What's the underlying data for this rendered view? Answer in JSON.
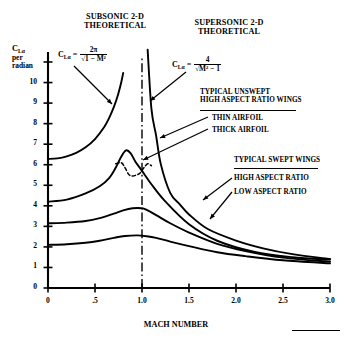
{
  "chart_data": {
    "type": "line",
    "xlabel": "MACH NUMBER",
    "ylabel": "C_Lα per radian",
    "xlim": [
      0,
      3.0
    ],
    "ylim": [
      0,
      11
    ],
    "grid": false,
    "legend_position": "right-annotations",
    "xticks": [
      "0",
      ".5",
      "1.0",
      "1.5",
      "2.0",
      "2.5",
      "3.0"
    ],
    "xtick_values": [
      0,
      0.5,
      1.0,
      1.5,
      2.0,
      2.5,
      3.0
    ],
    "yticks": [
      "0",
      "1",
      "2",
      "3",
      "4",
      "5",
      "6",
      "7",
      "8",
      "9",
      "10"
    ],
    "ytick_values": [
      0,
      1,
      2,
      3,
      4,
      5,
      6,
      7,
      8,
      9,
      10
    ],
    "annotations": [
      {
        "text": "SUBSONIC 2-D THEORETICAL",
        "formula": "C_Lα = 2π / √(1 − M²)"
      },
      {
        "text": "SUPERSONIC 2-D THEORETICAL",
        "formula": "C_Lα = 4 / √(M² − 1)"
      },
      {
        "text": "TYPICAL UNSWEPT HIGH ASPECT RATIO WINGS"
      },
      {
        "text": "THIN AIRFOIL"
      },
      {
        "text": "THICK AIRFOIL"
      },
      {
        "text": "TYPICAL SWEPT WINGS"
      },
      {
        "text": "HIGH ASPECT RATIO"
      },
      {
        "text": "LOW ASPECT RATIO"
      }
    ],
    "sonic_line_mach": 1.0,
    "series": [
      {
        "name": "SUBSONIC 2-D THEORETICAL",
        "style": "solid",
        "x": [
          0.0,
          0.1,
          0.2,
          0.3,
          0.4,
          0.5,
          0.6,
          0.65,
          0.7,
          0.74,
          0.78,
          0.8
        ],
        "values": [
          6.28,
          6.31,
          6.41,
          6.58,
          6.85,
          7.25,
          7.85,
          8.27,
          8.8,
          9.33,
          10.03,
          10.47
        ]
      },
      {
        "name": "SUPERSONIC 2-D THEORETICAL",
        "style": "solid",
        "x": [
          1.06,
          1.1,
          1.15,
          1.2,
          1.3,
          1.4,
          1.5,
          1.7,
          2.0,
          2.3,
          2.6,
          3.0
        ],
        "values": [
          11.6,
          8.73,
          7.42,
          6.03,
          4.63,
          4.08,
          3.58,
          2.87,
          2.31,
          1.92,
          1.65,
          1.41
        ]
      },
      {
        "name": "THIN AIRFOIL",
        "style": "solid",
        "x": [
          0.0,
          0.2,
          0.4,
          0.55,
          0.65,
          0.72,
          0.78,
          0.83,
          0.88,
          0.93,
          1.0,
          1.1,
          1.25,
          1.5,
          1.8,
          2.2,
          2.6,
          3.0
        ],
        "values": [
          4.2,
          4.3,
          4.6,
          4.95,
          5.35,
          5.85,
          6.4,
          6.7,
          6.55,
          6.15,
          5.7,
          5.05,
          4.2,
          3.1,
          2.3,
          1.75,
          1.5,
          1.38
        ]
      },
      {
        "name": "THICK AIRFOIL",
        "style": "dashed",
        "x": [
          0.72,
          0.78,
          0.82,
          0.86,
          0.9,
          0.94,
          0.98,
          1.02,
          1.06,
          1.1
        ],
        "values": [
          6.05,
          6.1,
          5.85,
          5.52,
          5.45,
          5.5,
          5.6,
          5.85,
          6.05,
          5.95
        ]
      },
      {
        "name": "HIGH ASPECT RATIO",
        "style": "solid",
        "x": [
          0.0,
          0.2,
          0.4,
          0.55,
          0.7,
          0.8,
          0.9,
          1.0,
          1.05,
          1.15,
          1.3,
          1.5,
          1.8,
          2.1,
          2.5,
          3.0
        ],
        "values": [
          3.15,
          3.18,
          3.26,
          3.4,
          3.62,
          3.78,
          3.88,
          3.88,
          3.8,
          3.55,
          3.15,
          2.7,
          2.15,
          1.8,
          1.48,
          1.28
        ]
      },
      {
        "name": "LOW ASPECT RATIO",
        "style": "solid",
        "x": [
          0.0,
          0.2,
          0.4,
          0.55,
          0.7,
          0.82,
          0.95,
          1.05,
          1.15,
          1.3,
          1.5,
          1.8,
          2.1,
          2.5,
          3.0
        ],
        "values": [
          2.1,
          2.13,
          2.2,
          2.3,
          2.44,
          2.53,
          2.56,
          2.52,
          2.44,
          2.26,
          2.04,
          1.74,
          1.55,
          1.35,
          1.2
        ]
      }
    ]
  },
  "labels": {
    "subsonic_title_l1": "SUBSONIC 2-D",
    "subsonic_title_l2": "THEORETICAL",
    "supersonic_title_l1": "SUPERSONIC 2-D",
    "supersonic_title_l2": "THEORETICAL",
    "y_axis_l1": "C",
    "y_axis_sub": "Lα",
    "y_axis_l2": "per",
    "y_axis_l3": "radian",
    "x_axis": "MACH NUMBER",
    "unswept_l1": "TYPICAL UNSWEPT",
    "unswept_l2": "HIGH ASPECT RATIO WINGS",
    "thin_airfoil": "THIN AIRFOIL",
    "thick_airfoil": "THICK AIRFOIL",
    "swept": "TYPICAL SWEPT WINGS",
    "high_ar": "HIGH ASPECT RATIO",
    "low_ar": "LOW ASPECT RATIO",
    "formula_lhs": "C",
    "formula_lhs_sub": "Lα",
    "formula_eq": "=",
    "sub_num": "2π",
    "sub_den": "1 − M²",
    "sup_num": "4",
    "sup_den": "M² − 1",
    "surd": "√"
  },
  "colors": {
    "ink": "#000000",
    "background": "#ffffff"
  }
}
